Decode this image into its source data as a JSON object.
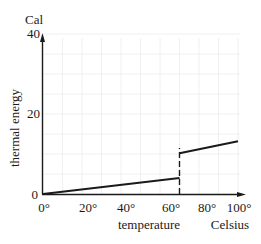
{
  "chart_data": {
    "type": "line",
    "title": "",
    "xlabel": "temperature",
    "xunit": "Celsius",
    "ylabel": "thermal energy",
    "yunit": "Cal",
    "xlim": [
      0,
      100
    ],
    "ylim": [
      0,
      40
    ],
    "x_ticks": [
      "0°",
      "20°",
      "40°",
      "60°",
      "80°",
      "100°"
    ],
    "x_tick_values": [
      0,
      20,
      40,
      60,
      80,
      100
    ],
    "y_ticks": [
      "0",
      "20",
      "40"
    ],
    "y_tick_values": [
      0,
      20,
      40
    ],
    "grid": true,
    "series": [
      {
        "name": "below transition",
        "x": [
          0,
          70
        ],
        "y": [
          0,
          4
        ]
      },
      {
        "name": "above transition",
        "x": [
          70,
          100
        ],
        "y": [
          10.2,
          13.2
        ]
      }
    ],
    "annotations": [
      {
        "type": "dashed-vertical",
        "x": 70,
        "y_from": 0,
        "y_to": 11.5,
        "note": "discontinuous jump in thermal energy"
      }
    ],
    "colors": {
      "line": "#1a1a1a",
      "axis": "#1a1a1a",
      "grid": "#ececec"
    }
  }
}
